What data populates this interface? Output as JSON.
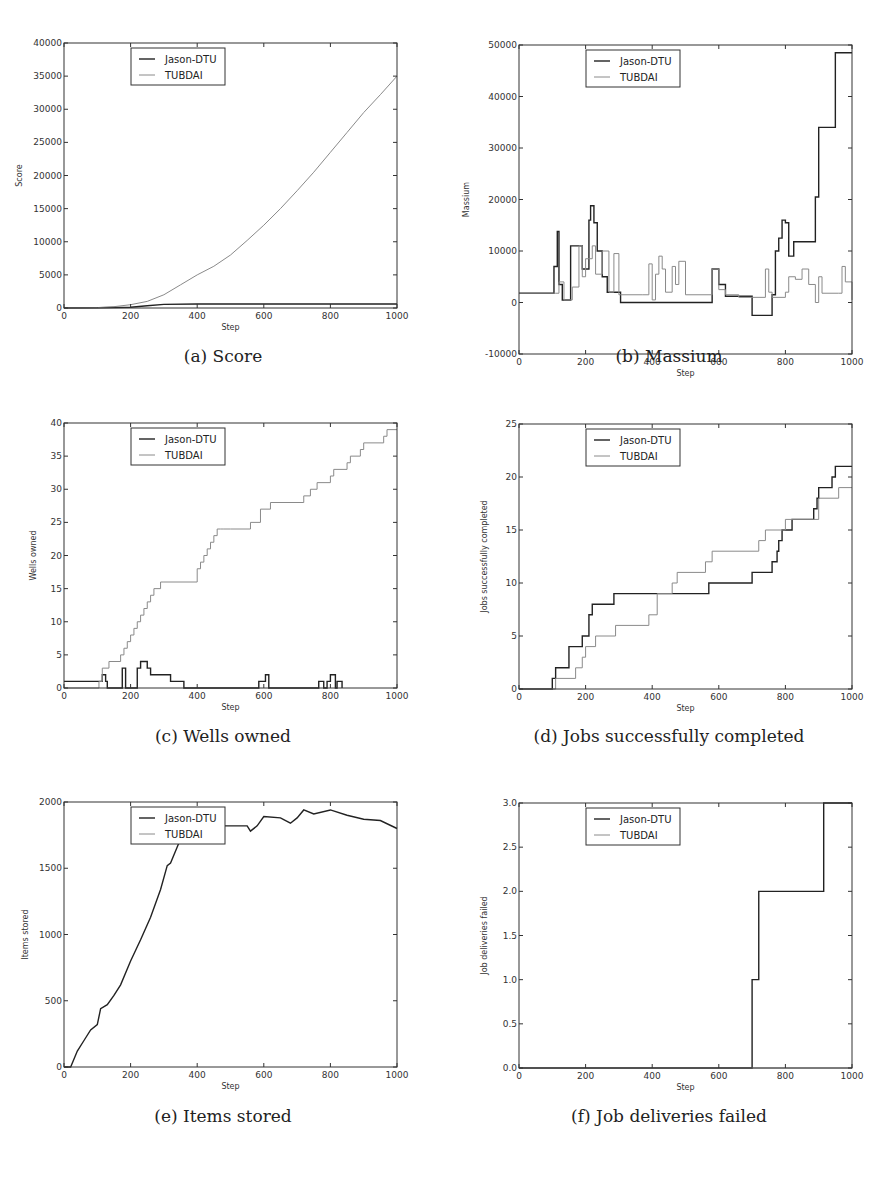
{
  "figure": {
    "legend": [
      "Jason-DTU",
      "TUBDAI"
    ],
    "colors": {
      "Jason-DTU": "#222222",
      "TUBDAI": "#8a8a8a"
    }
  },
  "chart_data": [
    {
      "id": "a",
      "caption": "(a) Score",
      "type": "line",
      "xlabel": "Step",
      "ylabel": "Score",
      "xlim": [
        0,
        1000
      ],
      "ylim": [
        0,
        40000
      ],
      "xticks": [
        0,
        200,
        400,
        600,
        800,
        1000
      ],
      "yticks": [
        0,
        5000,
        10000,
        15000,
        20000,
        25000,
        30000,
        35000,
        40000
      ],
      "legend_position": "upper-left-inset",
      "grid": false,
      "series": [
        {
          "name": "Jason-DTU",
          "x": [
            0,
            100,
            200,
            250,
            300,
            400,
            600,
            800,
            1000
          ],
          "y": [
            0,
            30,
            120,
            350,
            550,
            600,
            600,
            600,
            600
          ]
        },
        {
          "name": "TUBDAI",
          "x": [
            0,
            100,
            150,
            200,
            250,
            300,
            350,
            400,
            450,
            500,
            550,
            600,
            650,
            700,
            750,
            800,
            850,
            900,
            950,
            1000
          ],
          "y": [
            0,
            50,
            200,
            500,
            1000,
            2000,
            3500,
            5000,
            6300,
            8000,
            10200,
            12500,
            15000,
            17700,
            20500,
            23500,
            26500,
            29500,
            32200,
            35000
          ]
        }
      ]
    },
    {
      "id": "b",
      "caption": "(b) Massium",
      "type": "line",
      "xlabel": "Step",
      "ylabel": "Massium",
      "xlim": [
        0,
        1000
      ],
      "ylim": [
        -10000,
        50000
      ],
      "xticks": [
        0,
        200,
        400,
        600,
        800,
        1000
      ],
      "yticks": [
        -10000,
        0,
        10000,
        20000,
        30000,
        40000,
        50000
      ],
      "legend_position": "upper-left-inset",
      "grid": false,
      "series": [
        {
          "name": "Jason-DTU",
          "step": true,
          "x": [
            0,
            100,
            105,
            115,
            120,
            130,
            150,
            155,
            170,
            190,
            210,
            215,
            225,
            235,
            250,
            265,
            280,
            290,
            305,
            570,
            580,
            600,
            620,
            660,
            700,
            760,
            770,
            780,
            790,
            800,
            810,
            820,
            825,
            885,
            890,
            900,
            950,
            1000
          ],
          "y": [
            1800,
            1800,
            7000,
            13800,
            3500,
            500,
            500,
            11000,
            11000,
            6500,
            16000,
            18800,
            15500,
            10000,
            5000,
            2000,
            2000,
            2000,
            0,
            0,
            6500,
            3500,
            1200,
            1200,
            -2500,
            1500,
            10000,
            12500,
            16000,
            15500,
            9000,
            9000,
            11800,
            11800,
            20500,
            34000,
            48500,
            48500
          ]
        },
        {
          "name": "TUBDAI",
          "step": true,
          "x": [
            0,
            110,
            120,
            135,
            160,
            180,
            190,
            200,
            220,
            230,
            250,
            270,
            285,
            300,
            370,
            390,
            400,
            410,
            420,
            430,
            440,
            460,
            470,
            480,
            500,
            580,
            600,
            620,
            660,
            700,
            740,
            750,
            760,
            800,
            810,
            830,
            850,
            870,
            890,
            900,
            910,
            960,
            970,
            980,
            1000
          ],
          "y": [
            1800,
            1800,
            4000,
            500,
            3000,
            11000,
            5000,
            8500,
            11000,
            5500,
            10000,
            2000,
            9500,
            1500,
            1500,
            7500,
            500,
            5500,
            9000,
            6500,
            2000,
            7000,
            3500,
            8000,
            1500,
            6500,
            2500,
            1500,
            1000,
            1000,
            6500,
            2000,
            1000,
            2000,
            5000,
            4500,
            6500,
            3500,
            0,
            5000,
            1800,
            1800,
            7000,
            4000,
            500
          ]
        }
      ]
    },
    {
      "id": "c",
      "caption": "(c) Wells owned",
      "type": "line",
      "xlabel": "Step",
      "ylabel": "Wells owned",
      "xlim": [
        0,
        1000
      ],
      "ylim": [
        0,
        40
      ],
      "xticks": [
        0,
        200,
        400,
        600,
        800,
        1000
      ],
      "yticks": [
        0,
        5,
        10,
        15,
        20,
        25,
        30,
        35,
        40
      ],
      "legend_position": "upper-left-inset",
      "grid": false,
      "series": [
        {
          "name": "Jason-DTU",
          "step": true,
          "x": [
            0,
            60,
            110,
            115,
            125,
            130,
            170,
            175,
            185,
            210,
            220,
            230,
            240,
            250,
            260,
            280,
            300,
            320,
            360,
            585,
            605,
            615,
            765,
            780,
            790,
            800,
            815,
            820,
            835
          ],
          "y": [
            1,
            1,
            1,
            2,
            1,
            0,
            0,
            3,
            0,
            0,
            3,
            4,
            4,
            3,
            2,
            2,
            2,
            1,
            0,
            1,
            2,
            0,
            1,
            0,
            1,
            2,
            0,
            1,
            0
          ]
        },
        {
          "name": "TUBDAI",
          "step": true,
          "x": [
            0,
            105,
            115,
            135,
            170,
            180,
            190,
            200,
            210,
            220,
            230,
            240,
            250,
            260,
            270,
            290,
            300,
            400,
            410,
            420,
            430,
            440,
            450,
            460,
            470,
            480,
            500,
            560,
            590,
            620,
            720,
            740,
            760,
            800,
            810,
            850,
            860,
            890,
            900,
            960,
            970,
            1000
          ],
          "y": [
            0,
            1,
            3,
            4,
            5,
            6,
            7,
            8,
            9,
            10,
            11,
            12,
            13,
            14,
            15,
            16,
            16,
            18,
            19,
            20,
            21,
            22,
            23,
            24,
            24,
            24,
            24,
            25,
            27,
            28,
            29,
            30,
            31,
            32,
            33,
            34,
            35,
            36,
            37,
            38,
            39,
            39
          ]
        }
      ]
    },
    {
      "id": "d",
      "caption": "(d) Jobs successfully completed",
      "type": "line",
      "xlabel": "Step",
      "ylabel": "Jobs successfully completed",
      "xlim": [
        0,
        1000
      ],
      "ylim": [
        0,
        25
      ],
      "xticks": [
        0,
        200,
        400,
        600,
        800,
        1000
      ],
      "yticks": [
        0,
        5,
        10,
        15,
        20,
        25
      ],
      "legend_position": "upper-left-inset",
      "grid": false,
      "series": [
        {
          "name": "Jason-DTU",
          "step": true,
          "x": [
            0,
            100,
            110,
            150,
            190,
            210,
            220,
            285,
            570,
            700,
            760,
            775,
            780,
            790,
            800,
            820,
            885,
            895,
            900,
            940,
            950,
            1000
          ],
          "y": [
            0,
            1,
            2,
            4,
            5,
            7,
            8,
            9,
            10,
            11,
            12,
            13,
            14,
            15,
            15,
            16,
            17,
            18,
            19,
            20,
            21,
            21
          ]
        },
        {
          "name": "TUBDAI",
          "step": true,
          "x": [
            0,
            110,
            170,
            190,
            200,
            230,
            290,
            390,
            415,
            460,
            475,
            560,
            580,
            720,
            740,
            800,
            820,
            900,
            960,
            1000
          ],
          "y": [
            0,
            1,
            2,
            3,
            4,
            5,
            6,
            7,
            9,
            10,
            11,
            12,
            13,
            14,
            15,
            16,
            16,
            18,
            19,
            19
          ]
        }
      ]
    },
    {
      "id": "e",
      "caption": "(e) Items stored",
      "type": "line",
      "xlabel": "Step",
      "ylabel": "Items stored",
      "xlim": [
        0,
        1000
      ],
      "ylim": [
        0,
        2000
      ],
      "xticks": [
        0,
        200,
        400,
        600,
        800,
        1000
      ],
      "yticks": [
        0,
        500,
        1000,
        1500,
        2000
      ],
      "legend_position": "upper-left-inset",
      "grid": false,
      "series": [
        {
          "name": "Jason-DTU",
          "x": [
            0,
            20,
            40,
            60,
            80,
            100,
            110,
            130,
            150,
            170,
            200,
            230,
            260,
            290,
            310,
            320,
            340,
            360,
            400,
            500,
            550,
            560,
            580,
            600,
            650,
            680,
            700,
            720,
            750,
            800,
            850,
            900,
            950,
            1000
          ],
          "y": [
            0,
            0,
            120,
            200,
            280,
            320,
            440,
            470,
            540,
            620,
            800,
            960,
            1130,
            1340,
            1520,
            1540,
            1660,
            1780,
            1820,
            1820,
            1820,
            1780,
            1820,
            1890,
            1880,
            1840,
            1880,
            1940,
            1910,
            1940,
            1900,
            1870,
            1860,
            1800
          ]
        },
        {
          "name": "TUBDAI",
          "x": [],
          "y": []
        }
      ]
    },
    {
      "id": "f",
      "caption": "(f) Job deliveries failed",
      "type": "line",
      "xlabel": "Step",
      "ylabel": "Job deliveries failed",
      "xlim": [
        0,
        1000
      ],
      "ylim": [
        0.0,
        3.0
      ],
      "xticks": [
        0,
        200,
        400,
        600,
        800,
        1000
      ],
      "yticks": [
        0.0,
        0.5,
        1.0,
        1.5,
        2.0,
        2.5,
        3.0
      ],
      "ytick_labels": [
        "0.0",
        "0.5",
        "1.0",
        "1.5",
        "2.0",
        "2.5",
        "3.0"
      ],
      "legend_position": "upper-left-inset",
      "grid": false,
      "series": [
        {
          "name": "Jason-DTU",
          "step": true,
          "x": [
            0,
            700,
            720,
            915,
            1000
          ],
          "y": [
            0,
            1,
            2,
            3,
            3
          ]
        },
        {
          "name": "TUBDAI",
          "step": true,
          "x": [
            0,
            1000
          ],
          "y": [
            0,
            0
          ]
        }
      ]
    }
  ]
}
